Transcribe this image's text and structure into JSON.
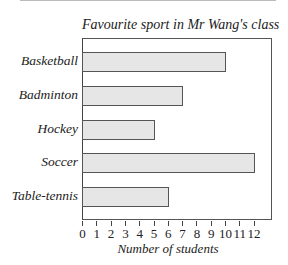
{
  "chart_data": {
    "type": "bar",
    "orientation": "horizontal",
    "title": "Favourite sport in Mr Wang's class",
    "xlabel": "Number of students",
    "ylabel": "",
    "categories": [
      "Basketball",
      "Badminton",
      "Hockey",
      "Soccer",
      "Table-tennis"
    ],
    "values": [
      10,
      7,
      5,
      12,
      6
    ],
    "xlim": [
      0,
      12
    ],
    "xticks": [
      "0",
      "1",
      "2",
      "3",
      "4",
      "5",
      "6",
      "7",
      "8",
      "9",
      "10",
      "11",
      "12"
    ],
    "grid": false,
    "legend": null,
    "bar_color": "#e6e6e6"
  }
}
